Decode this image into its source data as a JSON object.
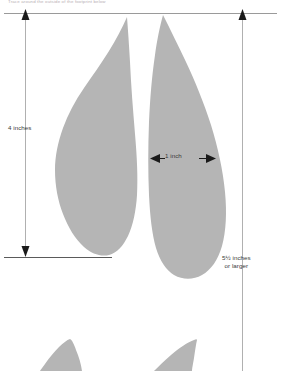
{
  "document": {
    "title": "Footprint sizing diagram",
    "top_caption": "Trace around the outside of the footprint below"
  },
  "colors": {
    "footprint_fill": "#b5b5b5",
    "rule_line": "#9a9a9a",
    "dimension_line": "#b0b0b0",
    "arrow": "#1a1a1a",
    "label_text": "#3a3a3a",
    "caption_text": "#b8b0b4",
    "background": "#ffffff"
  },
  "dimensions": [
    {
      "id": "height-left",
      "label": "4 inches",
      "orientation": "vertical",
      "value": 4,
      "unit": "inches",
      "arrow_ends": "both",
      "x": 25,
      "y_top": 14,
      "y_bottom": 257
    },
    {
      "id": "width-top",
      "label": "1 inch",
      "orientation": "horizontal",
      "value": 1,
      "unit": "inch",
      "arrow_ends": "both",
      "y": 158,
      "x_left": 152,
      "x_right": 215
    },
    {
      "id": "height-right",
      "label_line1": "5½ inches",
      "label_line2": "or larger",
      "orientation": "vertical",
      "value": 5.5,
      "unit": "inches",
      "qualifier": "or larger",
      "arrow_ends": "top",
      "x": 242,
      "y_top": 14,
      "y_bottom": 371
    }
  ],
  "rules": [
    {
      "id": "top-rule",
      "y": 13,
      "x_start": 4,
      "x_end": 277
    },
    {
      "id": "baseline-rule",
      "y": 257,
      "x_start": 4,
      "x_end": 112
    }
  ],
  "shapes": [
    {
      "id": "footprint-left",
      "name": "left-forefoot-outline",
      "side": "left"
    },
    {
      "id": "footprint-right",
      "name": "right-forefoot-outline",
      "side": "right"
    },
    {
      "id": "heel-left",
      "name": "left-heel-fragment",
      "side": "left"
    },
    {
      "id": "heel-right",
      "name": "right-heel-fragment",
      "side": "right"
    }
  ]
}
